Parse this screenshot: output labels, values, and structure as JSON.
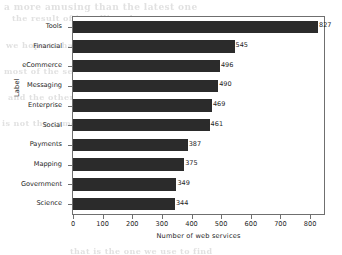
{
  "chart_data": {
    "type": "bar",
    "orientation": "horizontal",
    "title": "",
    "xlabel": "Number of web services",
    "ylabel": "Label",
    "categories": [
      "Tools",
      "Financial",
      "eCommerce",
      "Messaging",
      "Enterprise",
      "Social",
      "Payments",
      "Mapping",
      "Government",
      "Science"
    ],
    "values": [
      827,
      545,
      496,
      490,
      469,
      461,
      387,
      375,
      349,
      344
    ],
    "value_labels": [
      "827",
      "545",
      "496",
      "490",
      "469",
      "461",
      "387",
      "375",
      "349",
      "344"
    ],
    "xlim": [
      0,
      847
    ],
    "xticks": [
      0,
      100,
      200,
      300,
      400,
      500,
      600,
      700,
      800
    ],
    "xtick_labels": [
      "0",
      "100",
      "200",
      "300",
      "400",
      "500",
      "600",
      "700",
      "800"
    ],
    "grid": false,
    "legend": null,
    "bar_color": "#2b2b2b",
    "frame_color": "#6f6f6f",
    "background_color": "#ffffff"
  },
  "background_artifacts": [
    {
      "text": "a more amusing than the latest one",
      "x": 4,
      "y": 2,
      "size": 9
    },
    {
      "text": "the result of installing the one",
      "x": 12,
      "y": 13,
      "size": 8
    },
    {
      "text": "we hope to have better",
      "x": 6,
      "y": 40,
      "size": 8
    },
    {
      "text": "in a few more than some",
      "x": 200,
      "y": 40,
      "size": 8
    },
    {
      "text": "most of the service",
      "x": 4,
      "y": 66,
      "size": 8
    },
    {
      "text": "to be the same as",
      "x": 210,
      "y": 66,
      "size": 8
    },
    {
      "text": "and the other one",
      "x": 8,
      "y": 92,
      "size": 8
    },
    {
      "text": "the number of",
      "x": 230,
      "y": 92,
      "size": 8
    },
    {
      "text": "is not the same",
      "x": 2,
      "y": 118,
      "size": 8
    },
    {
      "text": "more of these",
      "x": 240,
      "y": 118,
      "size": 8
    },
    {
      "text": "the list of",
      "x": 270,
      "y": 145,
      "size": 8
    },
    {
      "text": "the result of a number",
      "x": 180,
      "y": 196,
      "size": 8
    },
    {
      "text": "that is the one we use to find",
      "x": 70,
      "y": 246,
      "size": 8
    }
  ]
}
